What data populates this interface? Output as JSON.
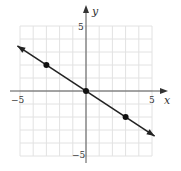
{
  "chart_data": {
    "type": "line",
    "title": "",
    "xlabel": "x",
    "ylabel": "y",
    "xlim": [
      -5,
      5
    ],
    "ylim": [
      -5,
      5
    ],
    "grid": true,
    "x_tick_labels": [
      "-5",
      "5"
    ],
    "y_tick_labels": [
      "5",
      "-5"
    ],
    "series": [
      {
        "name": "line",
        "equation": "y = -2/3 x",
        "slope": -0.6667,
        "intercept": 0,
        "extends_with_arrows": true,
        "x": [
          -5.2,
          5.2
        ],
        "y": [
          3.47,
          -3.47
        ]
      }
    ],
    "points": [
      {
        "x": -3,
        "y": 2
      },
      {
        "x": 0,
        "y": 0
      },
      {
        "x": 3,
        "y": -2
      }
    ]
  },
  "labels": {
    "x_axis": "x",
    "y_axis": "y",
    "x_min": "−5",
    "x_max": "5",
    "y_max": "5",
    "y_min": "−5"
  },
  "colors": {
    "grid": "#e2e2e2",
    "axis": "#555555",
    "line": "#222222",
    "point": "#111111"
  }
}
